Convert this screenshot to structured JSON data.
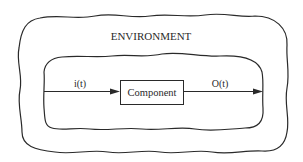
{
  "diagram": {
    "environment": {
      "label": "ENVIRONMENT"
    },
    "component": {
      "label": "Component"
    },
    "input": {
      "label": "i(t)"
    },
    "output": {
      "label": "O(t)"
    },
    "colors": {
      "stroke": "#2a2a2a",
      "background": "#ffffff"
    }
  }
}
